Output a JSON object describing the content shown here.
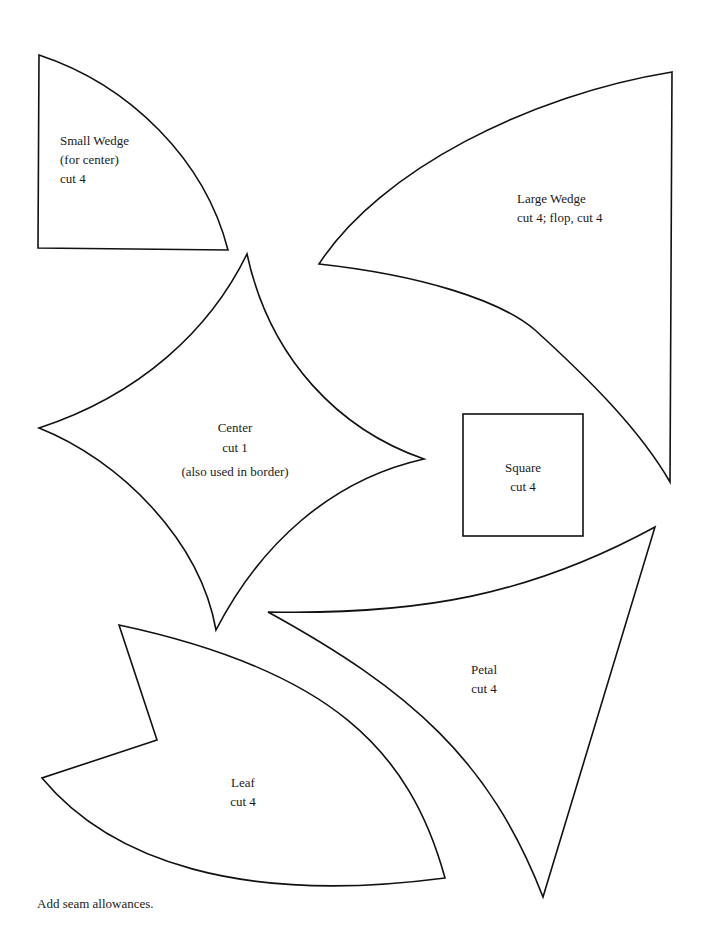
{
  "page": {
    "background": "#ffffff",
    "stroke_color": "#111111"
  },
  "pieces": {
    "small_wedge": {
      "name": "Small Wedge",
      "note": "(for center)",
      "cut": "cut 4"
    },
    "large_wedge": {
      "name": "Large Wedge",
      "cut": "cut 4; flop, cut 4"
    },
    "center": {
      "name": "Center",
      "cut": "cut 1",
      "note": "(also used in  border)"
    },
    "square": {
      "name": "Square",
      "cut": "cut 4"
    },
    "petal": {
      "name": "Petal",
      "cut": "cut 4"
    },
    "leaf": {
      "name": "Leaf",
      "cut": "cut 4"
    }
  },
  "footer": {
    "note": "Add seam allowances."
  }
}
